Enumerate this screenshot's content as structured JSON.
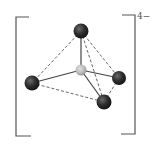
{
  "diagram": {
    "type": "molecular-structure",
    "geometry": "tetrahedral",
    "charge_label": "4−",
    "colors": {
      "outer_atom": "#2a2a2a",
      "central_atom": "#b8b8b8",
      "bond": "#444444",
      "edge": "#555555",
      "bracket": "#555555"
    },
    "atoms": [
      {
        "id": "top",
        "role": "ligand",
        "x": 81,
        "y": 31,
        "r": 7.5
      },
      {
        "id": "left",
        "role": "ligand",
        "x": 32,
        "y": 83,
        "r": 7.5
      },
      {
        "id": "right",
        "role": "ligand",
        "x": 119,
        "y": 78,
        "r": 7
      },
      {
        "id": "bottom",
        "role": "ligand",
        "x": 104,
        "y": 102,
        "r": 7.5
      },
      {
        "id": "center",
        "role": "central",
        "x": 81,
        "y": 70,
        "r": 5.5
      }
    ],
    "bonds": [
      {
        "from": "center",
        "to": "top",
        "style": "solid"
      },
      {
        "from": "center",
        "to": "left",
        "style": "solid"
      },
      {
        "from": "center",
        "to": "right",
        "style": "solid"
      },
      {
        "from": "center",
        "to": "bottom",
        "style": "solid"
      }
    ],
    "edges": [
      {
        "from": "top",
        "to": "left",
        "style": "dashed"
      },
      {
        "from": "top",
        "to": "right",
        "style": "dashed"
      },
      {
        "from": "top",
        "to": "bottom",
        "style": "dashed"
      },
      {
        "from": "left",
        "to": "bottom",
        "style": "dashed"
      },
      {
        "from": "right",
        "to": "bottom",
        "style": "dashed"
      }
    ]
  }
}
